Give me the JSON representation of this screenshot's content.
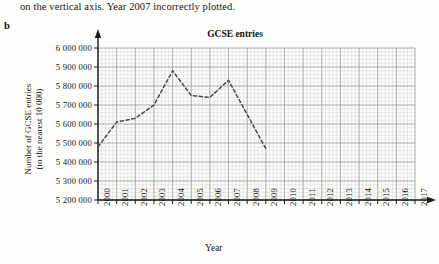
{
  "intro": {
    "text": "on the vertical axis. Year 2007 incorrectly plotted."
  },
  "part": {
    "label": "b"
  },
  "chart_data": {
    "type": "line",
    "title": "GCSE entries",
    "xlabel": "Year",
    "ylabel_line1": "Number of GCSE entries",
    "ylabel_line2": "(to the nearest 10 000)",
    "xlim": [
      2000,
      2017
    ],
    "ylim": [
      5200000,
      6000000
    ],
    "grid": true,
    "minor_grid": true,
    "legend": "none",
    "line_style": "dashed",
    "categories": [
      2000,
      2001,
      2002,
      2003,
      2004,
      2005,
      2006,
      2007,
      2008,
      2009
    ],
    "values": [
      5480000,
      5610000,
      5630000,
      5700000,
      5880000,
      5750000,
      5740000,
      5830000,
      5650000,
      5470000
    ],
    "ytick_labels": [
      "6 000 000",
      "5 900 000",
      "5 800 000",
      "5 700 000",
      "5 600 000",
      "5 500 000",
      "5 400 000",
      "5 300 000",
      "5 200 000"
    ],
    "ytick_values": [
      6000000,
      5900000,
      5800000,
      5700000,
      5600000,
      5500000,
      5400000,
      5300000,
      5200000
    ],
    "xtick_labels": [
      "2000",
      "2001",
      "2002",
      "2003",
      "2004",
      "2005",
      "2006",
      "2007",
      "2008",
      "2009",
      "2010",
      "2011",
      "2012",
      "2013",
      "2014",
      "2015",
      "2016",
      "2017"
    ],
    "colors": {
      "line": "#4a4a4a",
      "axis": "#1a1a1a",
      "major_grid": "#9a9a9a",
      "minor_grid": "#d4d4d4",
      "background": "#fdfdfb"
    }
  }
}
